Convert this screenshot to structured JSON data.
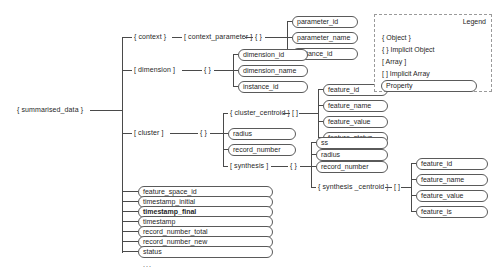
{
  "diagram": {
    "root": {
      "label": "{ summarised_data }"
    },
    "branches": {
      "context": {
        "label": "{ context }"
      },
      "context_parameter": {
        "label": "[ context_parameter ]"
      },
      "context_parameter_implicit": {
        "label": "{ }"
      },
      "context_parameter_props": [
        "parameter_id",
        "parameter_name",
        "instance_id"
      ],
      "dimension": {
        "label": "[ dimension ]"
      },
      "dimension_implicit": {
        "label": "{ }"
      },
      "dimension_props": [
        "dimension_id",
        "dimension_name",
        "instance_id"
      ],
      "cluster": {
        "label": "[ cluster ]"
      },
      "cluster_implicit": {
        "label": "{ }"
      },
      "cluster_centroid": {
        "label": "{ cluster_centroid }"
      },
      "cluster_centroid_array": {
        "label": "[ ]"
      },
      "cluster_centroid_props": [
        "feature_id",
        "feature_name",
        "feature_value",
        "feature_status"
      ],
      "cluster_props": [
        "radius",
        "record_number"
      ],
      "synthesis": {
        "label": "[ synthesis ]"
      },
      "synthesis_implicit": {
        "label": "{ }"
      },
      "synthesis_props": [
        "ss",
        "radius",
        "record_number"
      ],
      "synthesis_centroid": {
        "label": "{ synthesis _centroid }"
      },
      "synthesis_centroid_array": {
        "label": "[ ]"
      },
      "synthesis_centroid_props": [
        "feature_id",
        "feature_name",
        "feature_value",
        "feature_is"
      ],
      "root_props": [
        {
          "label": "feature_space_id",
          "bold": false
        },
        {
          "label": "timestamp_initial",
          "bold": false
        },
        {
          "label": "timestamp_final",
          "bold": true
        },
        {
          "label": "timestamp",
          "bold": false
        },
        {
          "label": "record_number_total",
          "bold": false
        },
        {
          "label": "record_number_new",
          "bold": false
        },
        {
          "label": "status",
          "bold": false
        }
      ],
      "root_more": "..."
    }
  },
  "legend": {
    "title": "Legend",
    "rows": [
      "{ Object }",
      "{ } Implicit Object",
      "[ Array ]",
      "[ ] Implicit Array"
    ],
    "property": "Property"
  }
}
